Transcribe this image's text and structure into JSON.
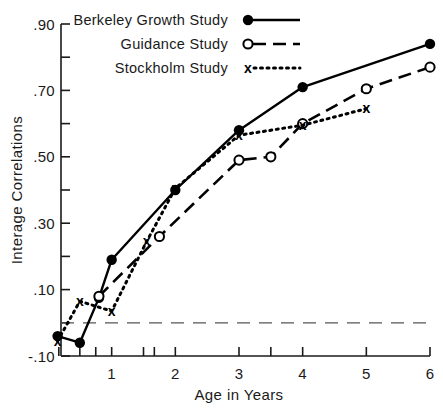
{
  "chart_data": {
    "type": "line",
    "title": "",
    "xlabel": "Age in Years",
    "ylabel": "Interage Correlations",
    "xlim": [
      0,
      6.1
    ],
    "ylim": [
      -0.1,
      0.9
    ],
    "grid": false,
    "zero_reference_line": 0.0,
    "legend_position": "top-center",
    "y_tick_labels": [
      ".90",
      ".70",
      ".50",
      ".30",
      ".10",
      "-.10"
    ],
    "y_tick_values": [
      0.9,
      0.7,
      0.5,
      0.3,
      0.1,
      -0.1
    ],
    "y_minor_tick_values": [
      0.8,
      0.6,
      0.4,
      0.2,
      0.0
    ],
    "x_tick_labels": [
      "1",
      "2",
      "3",
      "4",
      "5",
      "6"
    ],
    "x_tick_values": [
      1,
      2,
      3,
      4,
      5,
      6
    ],
    "x_minor_tick_values": [
      0.17,
      0.5,
      0.75,
      1.5,
      1.67,
      3.5
    ],
    "series": [
      {
        "name": "Berkeley Growth Study",
        "marker": "filled-circle",
        "line_style": "solid",
        "color": "#000000",
        "points": [
          {
            "x": 0.15,
            "y": -0.04
          },
          {
            "x": 0.5,
            "y": -0.06
          },
          {
            "x": 0.8,
            "y": 0.075
          },
          {
            "x": 1.0,
            "y": 0.19
          },
          {
            "x": 2.0,
            "y": 0.4
          },
          {
            "x": 3.0,
            "y": 0.58
          },
          {
            "x": 4.0,
            "y": 0.71
          },
          {
            "x": 6.0,
            "y": 0.84
          }
        ]
      },
      {
        "name": "Guidance Study",
        "marker": "open-circle",
        "line_style": "dashed",
        "color": "#000000",
        "points": [
          {
            "x": 0.8,
            "y": 0.08
          },
          {
            "x": 1.75,
            "y": 0.26
          },
          {
            "x": 3.0,
            "y": 0.49
          },
          {
            "x": 3.5,
            "y": 0.5
          },
          {
            "x": 4.0,
            "y": 0.6
          },
          {
            "x": 5.0,
            "y": 0.705
          },
          {
            "x": 6.0,
            "y": 0.77
          }
        ]
      },
      {
        "name": "Stockholm Study",
        "marker": "x",
        "line_style": "dotted",
        "color": "#000000",
        "points": [
          {
            "x": 0.15,
            "y": -0.055
          },
          {
            "x": 0.5,
            "y": 0.065
          },
          {
            "x": 1.0,
            "y": 0.035
          },
          {
            "x": 1.55,
            "y": 0.245
          },
          {
            "x": 2.0,
            "y": 0.405
          },
          {
            "x": 3.0,
            "y": 0.565
          },
          {
            "x": 4.0,
            "y": 0.595
          },
          {
            "x": 5.0,
            "y": 0.645
          }
        ]
      }
    ]
  },
  "legend": {
    "entries": [
      {
        "label": "Berkeley Growth Study",
        "marker": "filled-circle",
        "line_style": "solid"
      },
      {
        "label": "Guidance Study",
        "marker": "open-circle",
        "line_style": "dashed"
      },
      {
        "label": "Stockholm Study",
        "marker": "x",
        "line_style": "dotted"
      }
    ]
  },
  "axes": {
    "y_title": "Interage Correlations",
    "x_title": "Age in Years"
  }
}
